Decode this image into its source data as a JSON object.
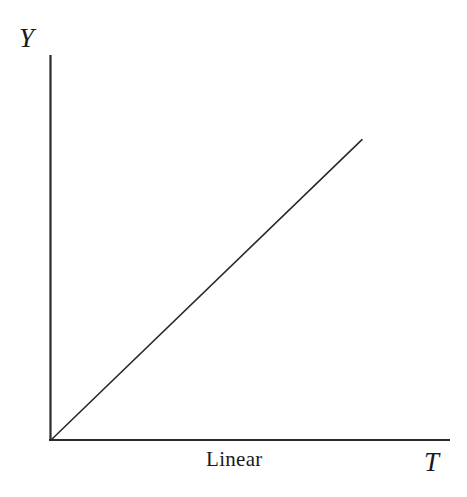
{
  "figure": {
    "background_color": "#ffffff",
    "ink_color": "#2a2a2a",
    "width": 467,
    "height": 497
  },
  "chart_data": {
    "type": "line",
    "title": "",
    "subtitle": "",
    "xlabel": "T",
    "ylabel": "Y",
    "annotations": [
      {
        "name": "curve-caption",
        "text": "Linear",
        "x_px": 206,
        "y_px": 449
      }
    ],
    "legend": [],
    "legend_position": "none",
    "grid": false,
    "xlim": [
      0,
      1
    ],
    "ylim": [
      0,
      1
    ],
    "xticks": [],
    "yticks": [],
    "xticklabels": [],
    "yticklabels": [],
    "series": [
      {
        "name": "Linear",
        "type": "line",
        "color": "#2a2a2a",
        "linewidth": 1.6,
        "x": [
          0.0,
          0.1,
          0.2,
          0.3,
          0.4,
          0.5,
          0.6,
          0.7,
          0.78
        ],
        "y": [
          0.0,
          0.1,
          0.2,
          0.3,
          0.4,
          0.5,
          0.6,
          0.7,
          0.78
        ],
        "slope": 1.0,
        "intercept": 0.0,
        "equation": "Y = k T"
      }
    ],
    "axes": {
      "origin_px": [
        50,
        440
      ],
      "y_axis_top_px": [
        50,
        55
      ],
      "x_axis_right_px": [
        450,
        440
      ],
      "spines": [
        "left",
        "bottom"
      ],
      "arrowheads": false,
      "linewidth": 2
    }
  },
  "labels": {
    "y_axis": "Y",
    "x_axis": "T",
    "caption": "Linear"
  }
}
